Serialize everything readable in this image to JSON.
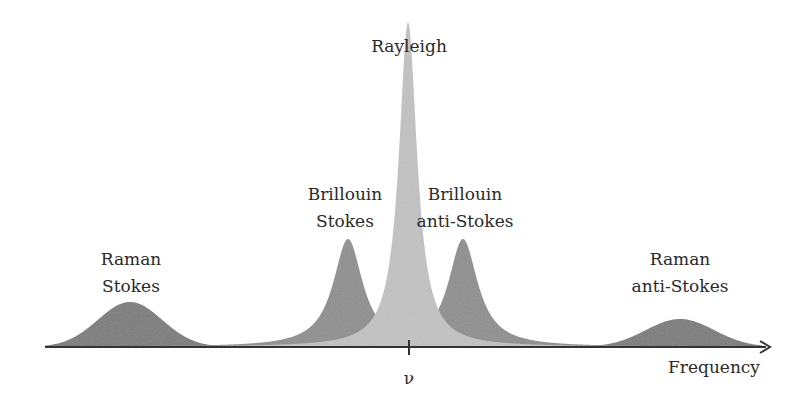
{
  "chart_data": {
    "type": "area",
    "title": "",
    "xlabel": "Frequency",
    "ylabel": "",
    "center_tick_label": "ν",
    "grid": false,
    "legend": "none",
    "axis": {
      "y_px": 347,
      "x_start_px": 45,
      "x_end_px": 770
    },
    "peaks": [
      {
        "name": "Raman Stokes",
        "label_lines": [
          "Raman",
          "Stokes"
        ],
        "center_px": 130,
        "height_px": 45,
        "width_px": 32,
        "shape": "gaussian",
        "color": "#7a7a7a"
      },
      {
        "name": "Brillouin Stokes",
        "label_lines": [
          "Brillouin",
          "Stokes"
        ],
        "center_px": 348,
        "height_px": 108,
        "width_px": 18,
        "shape": "lorentzian",
        "color": "#8e8e8e"
      },
      {
        "name": "Rayleigh",
        "label_lines": [
          "Rayleigh"
        ],
        "center_px": 408,
        "height_px": 325,
        "width_px": 11,
        "shape": "lorentzian",
        "color": "#c2c2c2"
      },
      {
        "name": "Brillouin anti-Stokes",
        "label_lines": [
          "Brillouin",
          "anti-Stokes"
        ],
        "center_px": 463,
        "height_px": 108,
        "width_px": 18,
        "shape": "lorentzian",
        "color": "#8e8e8e"
      },
      {
        "name": "Raman anti-Stokes",
        "label_lines": [
          "Raman",
          "anti-Stokes"
        ],
        "center_px": 680,
        "height_px": 28,
        "width_px": 34,
        "shape": "gaussian",
        "color": "#7a7a7a"
      }
    ],
    "labels": [
      {
        "text": "Rayleigh",
        "x": 409,
        "y": 52
      },
      {
        "text": "Brillouin",
        "x": 345,
        "y": 200
      },
      {
        "text": "Stokes",
        "x": 345,
        "y": 227
      },
      {
        "text": "Brillouin",
        "x": 465,
        "y": 200
      },
      {
        "text": "anti-Stokes",
        "x": 465,
        "y": 227
      },
      {
        "text": "Raman",
        "x": 131,
        "y": 265
      },
      {
        "text": "Stokes",
        "x": 131,
        "y": 292
      },
      {
        "text": "Raman",
        "x": 680,
        "y": 265
      },
      {
        "text": "anti-Stokes",
        "x": 680,
        "y": 292
      }
    ]
  }
}
